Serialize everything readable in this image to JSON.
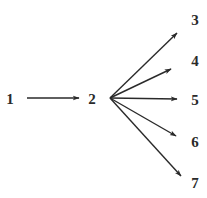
{
  "diagram": {
    "type": "directed-graph",
    "nodes": [
      {
        "id": "1",
        "label": "1",
        "x": 10,
        "y": 99
      },
      {
        "id": "2",
        "label": "2",
        "x": 92,
        "y": 99
      },
      {
        "id": "3",
        "label": "3",
        "x": 195,
        "y": 20
      },
      {
        "id": "4",
        "label": "4",
        "x": 195,
        "y": 61
      },
      {
        "id": "5",
        "label": "5",
        "x": 195,
        "y": 100
      },
      {
        "id": "6",
        "label": "6",
        "x": 195,
        "y": 142
      },
      {
        "id": "7",
        "label": "7",
        "x": 195,
        "y": 183
      }
    ],
    "edges": [
      {
        "from": "1",
        "to": "2"
      },
      {
        "from": "2",
        "to": "3"
      },
      {
        "from": "2",
        "to": "4"
      },
      {
        "from": "2",
        "to": "5"
      },
      {
        "from": "2",
        "to": "6"
      },
      {
        "from": "2",
        "to": "7"
      }
    ],
    "colors": {
      "line": "#2a2a2a",
      "background": "#ffffff"
    }
  }
}
